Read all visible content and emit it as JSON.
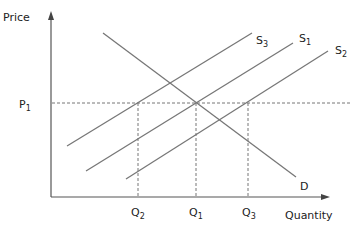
{
  "axes": {
    "y_label": "Price",
    "x_label": "Quantity"
  },
  "price_levels": [
    {
      "label": "P",
      "sub": "1"
    }
  ],
  "quantity_levels": [
    {
      "label": "Q",
      "sub": "2"
    },
    {
      "label": "Q",
      "sub": "1"
    },
    {
      "label": "Q",
      "sub": "3"
    }
  ],
  "curves": {
    "demand": {
      "label": "D"
    },
    "supply": [
      {
        "label": "S",
        "sub": "3"
      },
      {
        "label": "S",
        "sub": "1"
      },
      {
        "label": "S",
        "sub": "2"
      }
    ]
  },
  "colors": {
    "line": "#777777",
    "axis": "#555555",
    "text": "#222222"
  }
}
